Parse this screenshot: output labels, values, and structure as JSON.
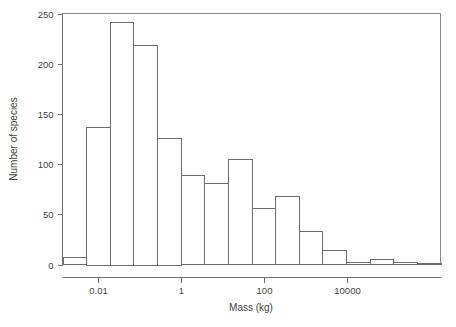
{
  "chart_data": {
    "type": "bar",
    "title": "",
    "subtitle": "",
    "xlabel": "Mass (kg)",
    "ylabel": "Number of species",
    "grid": false,
    "legend": false,
    "legend_position": "none",
    "x_scale": "log10",
    "ylim": [
      0,
      250
    ],
    "y_ticks": [
      0,
      50,
      100,
      150,
      200,
      250
    ],
    "y_tick_labels": [
      "0",
      "50",
      "100",
      "150",
      "200",
      "250"
    ],
    "x_ticks": [
      0.01,
      1,
      100,
      10000
    ],
    "x_tick_labels": [
      "0.01",
      "1",
      "100",
      "10000"
    ],
    "xlim_log10": [
      -2.85,
      6.25
    ],
    "bin_width_log10": 0.5688,
    "bin_edges_log10": [
      -2.85,
      -2.281,
      -1.713,
      -1.144,
      -0.575,
      -0.006,
      0.563,
      1.131,
      1.7,
      2.269,
      2.838,
      3.406,
      3.975,
      4.544,
      5.113,
      5.681,
      6.25
    ],
    "categories": [
      "10^-2.85 – 10^-2.28",
      "10^-2.28 – 10^-1.71",
      "10^-1.71 – 10^-1.14",
      "10^-1.14 – 10^-0.58",
      "10^-0.58 – 10^-0.01",
      "10^-0.01 – 10^0.56",
      "10^0.56 – 10^1.13",
      "10^1.13 – 10^1.70",
      "10^1.70 – 10^2.27",
      "10^2.27 – 10^2.84",
      "10^2.84 – 10^3.41",
      "10^3.41 – 10^3.97",
      "10^3.97 – 10^4.54",
      "10^4.54 – 10^5.11",
      "10^5.11 – 10^5.68",
      "10^5.68 – 10^6.25"
    ],
    "values": [
      7,
      137,
      242,
      219,
      126,
      89,
      81,
      105,
      56,
      68,
      33,
      14,
      2,
      5,
      2,
      1
    ],
    "series": [
      {
        "name": "Number of species",
        "values": [
          7,
          137,
          242,
          219,
          126,
          89,
          81,
          105,
          56,
          68,
          33,
          14,
          2,
          5,
          2,
          1
        ]
      }
    ],
    "colors": {
      "bar_fill": "#ffffff",
      "bar_stroke": "#6b6b6b",
      "axis": "#6e6e6e",
      "frame": "#8a8a8a",
      "text": "#3f3f3f",
      "background": "#ffffff"
    }
  }
}
